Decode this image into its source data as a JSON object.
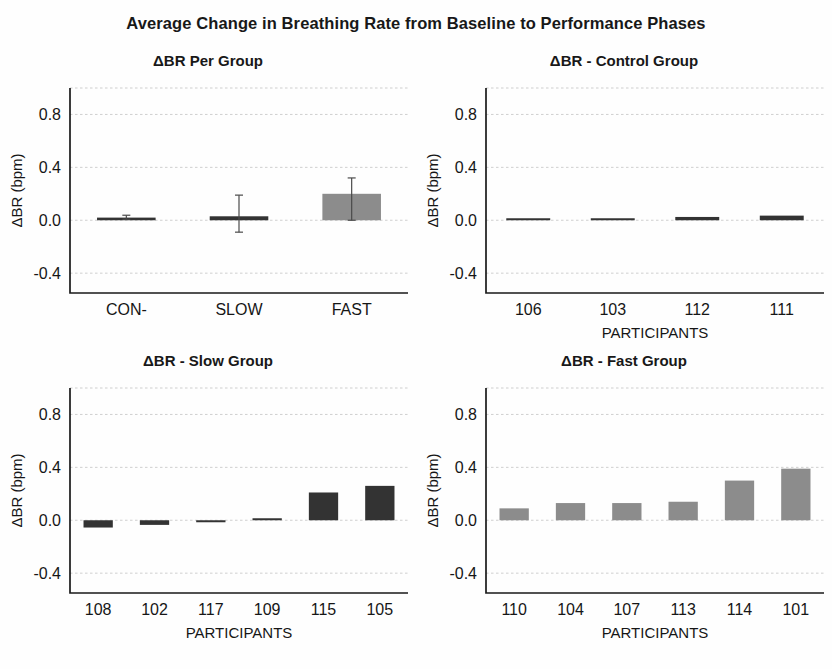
{
  "figure": {
    "title": "Average Change in Breathing Rate  from Baseline to Performance Phases",
    "background_color": "#fefefe",
    "dark_bar_color": "#333333",
    "gray_bar_color": "#8c8c8c",
    "axis_color": "#1a1a1a",
    "grid_color": "#c9c9c9"
  },
  "chart_data": [
    {
      "id": "group-summary",
      "type": "bar",
      "title": "ΔBR Per Group",
      "xlabel": "",
      "ylabel": "ΔBR (bpm)",
      "categories": [
        "CON-",
        "SLOW",
        "FAST"
      ],
      "values": [
        0.02,
        0.03,
        0.2
      ],
      "errors_low": [
        0.012,
        0.12,
        0.2
      ],
      "errors_high": [
        0.018,
        0.16,
        0.12
      ],
      "bar_colors": [
        "#333333",
        "#333333",
        "#8c8c8c"
      ],
      "ylim": [
        -0.55,
        1.0
      ],
      "yticks": [
        0.8,
        0.4,
        0.0,
        -0.4
      ],
      "ytick_labels": [
        "0.8",
        "0.4",
        "0.0",
        "-0.4"
      ],
      "grid": true,
      "legend": "none",
      "has_error_bars": true
    },
    {
      "id": "control-group",
      "type": "bar",
      "title": "ΔBR - Control Group",
      "xlabel": "PARTICIPANTS",
      "ylabel": "ΔBR (bpm)",
      "categories": [
        "106",
        "103",
        "112",
        "111"
      ],
      "values": [
        0.004,
        0.012,
        0.025,
        0.035
      ],
      "bar_colors": [
        "#333333",
        "#333333",
        "#333333",
        "#333333"
      ],
      "ylim": [
        -0.55,
        1.0
      ],
      "yticks": [
        0.8,
        0.4,
        0.0,
        -0.4
      ],
      "ytick_labels": [
        "0.8",
        "0.4",
        "0.0",
        "-0.4"
      ],
      "grid": true,
      "legend": "none",
      "has_error_bars": false
    },
    {
      "id": "slow-group",
      "type": "bar",
      "title": "ΔBR - Slow Group",
      "xlabel": "PARTICIPANTS",
      "ylabel": "ΔBR (bpm)",
      "categories": [
        "108",
        "102",
        "117",
        "109",
        "115",
        "105"
      ],
      "values": [
        -0.055,
        -0.035,
        -0.012,
        0.014,
        0.21,
        0.26
      ],
      "bar_colors": [
        "#333333",
        "#333333",
        "#333333",
        "#333333",
        "#333333",
        "#333333"
      ],
      "ylim": [
        -0.55,
        1.0
      ],
      "yticks": [
        0.8,
        0.4,
        0.0,
        -0.4
      ],
      "ytick_labels": [
        "0.8",
        "0.4",
        "0.0",
        "-0.4"
      ],
      "grid": true,
      "legend": "none",
      "has_error_bars": false
    },
    {
      "id": "fast-group",
      "type": "bar",
      "title": "ΔBR - Fast Group",
      "xlabel": "PARTICIPANTS",
      "ylabel": "ΔBR (bpm)",
      "categories": [
        "110",
        "104",
        "107",
        "113",
        "114",
        "101"
      ],
      "values": [
        0.09,
        0.13,
        0.13,
        0.14,
        0.3,
        0.39
      ],
      "bar_colors": [
        "#8c8c8c",
        "#8c8c8c",
        "#8c8c8c",
        "#8c8c8c",
        "#8c8c8c",
        "#8c8c8c"
      ],
      "ylim": [
        -0.55,
        1.0
      ],
      "yticks": [
        0.8,
        0.4,
        0.0,
        -0.4
      ],
      "ytick_labels": [
        "0.8",
        "0.4",
        "0.0",
        "-0.4"
      ],
      "grid": true,
      "legend": "none",
      "has_error_bars": false
    }
  ]
}
